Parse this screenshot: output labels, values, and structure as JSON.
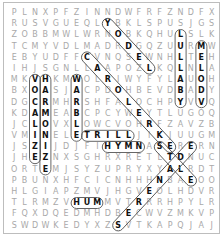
{
  "puzzle": {
    "rows": [
      "PLNXPFZINNDWFRFZNDFX",
      "RUSVGUEQLYBKLSPUSJGS",
      "ZOBBMWLWRNOBKQHULSLK",
      "TCMYVDLMADRDGQZUURMW",
      "EBYUDFFCVNQSEWNHLTEH",
      "IHJSGNLLAAPOZLKQLNLA",
      "MKVHKMWOLRIWYFYLAUOH",
      "BXOASJACPDOHBEVDBADY",
      "DGCRMHRSHFALOCHPYVVQ",
      "KDAMEABCPCYWEYTLUGOQ",
      "JCLOVXLOWCVOHRFZAVZB",
      "VMINELETRILLJIKJUUGM",
      "JSZIJDJFIHYMNASERERN",
      "JHEZNXSGHRXRETLTDNUC",
      "ORTEMJSYZUPRYXYALRDT",
      "PBUNXHFCICNHHHNBAEOO",
      "HLGIAPZMVJHGVEOLHDVR",
      "TLRMZVHUMMVTRRRHPYLR",
      "FQXDQEDMHDBECWVZMKVP",
      "SWDWKEDYXZSVTKAPQJAJ"
    ],
    "found_words": [
      {
        "word": "YODEL",
        "start": [
          1,
          9
        ],
        "end": [
          5,
          13
        ]
      },
      {
        "word": "LULLABY",
        "start": [
          2,
          16
        ],
        "end": [
          8,
          16
        ]
      },
      {
        "word": "MELODY",
        "start": [
          3,
          18
        ],
        "end": [
          8,
          18
        ]
      },
      {
        "word": "CAROLWHRI",
        "start": [
          4,
          7
        ],
        "end": [
          12,
          15
        ]
      },
      {
        "word": "VOCALIZE",
        "start": [
          6,
          2
        ],
        "end": [
          13,
          2
        ]
      },
      {
        "word": "HARMONIZE",
        "start": [
          6,
          3
        ],
        "end": [
          14,
          3
        ]
      },
      {
        "word": "WARBLE",
        "start": [
          6,
          6
        ],
        "end": [
          11,
          6
        ]
      },
      {
        "word": "TRILL",
        "start": [
          11,
          7
        ],
        "end": [
          11,
          11
        ]
      },
      {
        "word": "HYMN",
        "start": [
          12,
          9
        ],
        "end": [
          12,
          12
        ]
      },
      {
        "word": "STONE",
        "start": [
          12,
          14
        ],
        "end": [
          15,
          17
        ]
      },
      {
        "word": "SERENADE",
        "start": [
          19,
          10
        ],
        "end": [
          12,
          17
        ]
      },
      {
        "word": "HUM",
        "start": [
          17,
          6
        ],
        "end": [
          17,
          8
        ]
      }
    ],
    "colors": {
      "letter": "#a9a9a9",
      "found_letter": "#111111",
      "outline": "#555555",
      "border": "#bdbdbd"
    }
  }
}
